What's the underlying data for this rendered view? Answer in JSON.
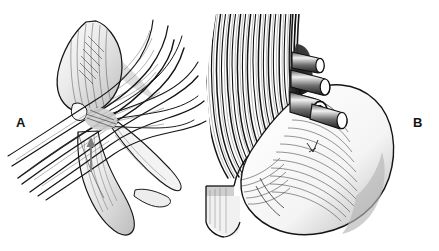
{
  "figure": {
    "kind": "anatomical-line-illustration",
    "style": "pen-and-ink hatched medical illustration",
    "background_color": "#ffffff",
    "ink_color": "#131313",
    "width": 439,
    "height": 251,
    "panels": [
      {
        "id": "A",
        "label": "A",
        "label_position": {
          "x": 16,
          "y": 116
        },
        "description": "Fan-shaped muscle with oval belly at upper left and radiating fibrous bands crossing a tubular structure below",
        "annotations": [
          {
            "type": "arrow",
            "name": "gray-up-arrow",
            "direction": "up",
            "color": "#808080",
            "tip": {
              "x": 91,
              "y": 139
            },
            "tail": {
              "x": 91,
              "y": 172
            }
          }
        ]
      },
      {
        "id": "B",
        "label": "B",
        "label_position": {
          "x": 413,
          "y": 116
        },
        "description": "Close-up of striated muscle fibers with four cut cylindrical vessels and a rounded organ bulge at right",
        "annotations": [
          {
            "type": "cut-tubes",
            "name": "vessel-bundle",
            "count": 4,
            "note": "one tube end shows an open annular lumen"
          }
        ]
      }
    ]
  },
  "labels": {
    "panel_a": "A",
    "panel_b": "B"
  }
}
